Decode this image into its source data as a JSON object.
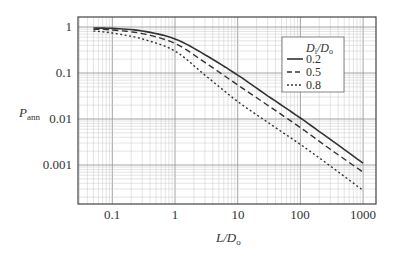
{
  "chart_data": {
    "type": "line",
    "title": "",
    "xlabel": "L/D_o",
    "ylabel": "P_ann",
    "xscale": "log",
    "yscale": "log",
    "xlim": [
      0.03,
      2000
    ],
    "ylim": [
      0.00014,
      1.6
    ],
    "grid": true,
    "x_ticks": [
      "0.1",
      "1",
      "10",
      "100",
      "1000"
    ],
    "y_ticks": [
      "1",
      "0.1",
      "0.01",
      "0.001"
    ],
    "legend": {
      "title": "D_i/D_o",
      "position": "upper right",
      "entries": [
        "0.2",
        "0.5",
        "0.8"
      ]
    },
    "x": [
      0.05,
      0.1,
      0.3,
      1,
      3,
      10,
      30,
      100,
      300,
      1000
    ],
    "series": [
      {
        "name": "0.2",
        "style": "solid",
        "values": [
          0.95,
          0.93,
          0.82,
          0.55,
          0.25,
          0.09,
          0.032,
          0.0105,
          0.0036,
          0.0011
        ]
      },
      {
        "name": "0.5",
        "style": "dashed",
        "values": [
          0.9,
          0.86,
          0.72,
          0.44,
          0.17,
          0.055,
          0.02,
          0.0065,
          0.0022,
          0.0007
        ]
      },
      {
        "name": "0.8",
        "style": "dotted",
        "values": [
          0.82,
          0.74,
          0.55,
          0.3,
          0.09,
          0.024,
          0.0085,
          0.0028,
          0.00095,
          0.00028
        ]
      }
    ]
  },
  "labels": {
    "y_axis_main": "P",
    "y_axis_sub": "ann",
    "x_axis_main": "L/D",
    "x_axis_sub": "o",
    "legend_title_a": "D",
    "legend_title_a_sub": "i",
    "legend_title_b": "/D",
    "legend_title_b_sub": "o",
    "legend_0": "0.2",
    "legend_1": "0.5",
    "legend_2": "0.8",
    "xtick_0": "0.1",
    "xtick_1": "1",
    "xtick_2": "10",
    "xtick_3": "100",
    "xtick_4": "1000",
    "ytick_0": "1",
    "ytick_1": "0.1",
    "ytick_2": "0.01",
    "ytick_3": "0.001"
  }
}
